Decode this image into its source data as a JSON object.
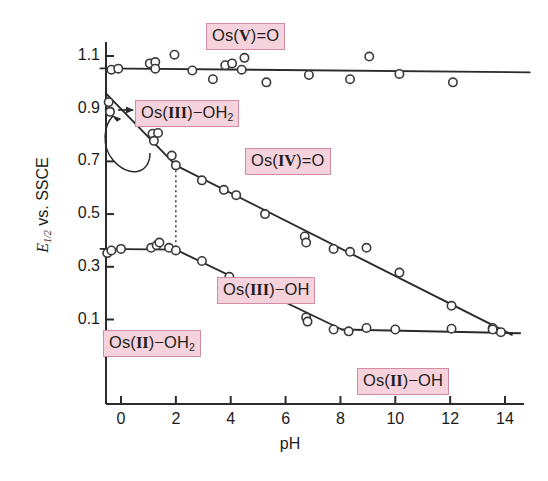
{
  "chart_data": {
    "type": "scatter",
    "title": "",
    "xlabel": "pH",
    "ylabel": "E1/2 vs. SSCE",
    "ylabel_parts": {
      "symbol": "E",
      "subscript": "1/2",
      "rest": " vs. SSCE"
    },
    "xlim": [
      -0.9,
      15.0
    ],
    "ylim": [
      -0.03,
      1.2
    ],
    "xticks": [
      "0",
      "2",
      "4",
      "6",
      "8",
      "10",
      "12",
      "14"
    ],
    "xtick_values": [
      0,
      2,
      4,
      6,
      8,
      10,
      12,
      14
    ],
    "yticks": [
      "1.1",
      "0.9",
      "0.7",
      "0.5",
      "0.3",
      "0.1"
    ],
    "ytick_values": [
      1.1,
      0.9,
      0.7,
      0.5,
      0.3,
      0.1
    ],
    "grid": false,
    "legend": "none",
    "marker": "open-circle",
    "series": [
      {
        "name": "Os(V)=O / Os(IV)=O couple",
        "points": [
          [
            -0.35,
            1.048
          ],
          [
            -0.1,
            1.052
          ],
          [
            1.05,
            1.072
          ],
          [
            1.25,
            1.077
          ],
          [
            1.25,
            1.052
          ],
          [
            1.95,
            1.105
          ],
          [
            2.6,
            1.045
          ],
          [
            3.35,
            1.012
          ],
          [
            3.8,
            1.065
          ],
          [
            4.05,
            1.072
          ],
          [
            4.4,
            1.048
          ],
          [
            4.5,
            1.093
          ],
          [
            5.3,
            1.0
          ],
          [
            6.85,
            1.028
          ],
          [
            8.35,
            1.012
          ],
          [
            9.05,
            1.098
          ],
          [
            10.15,
            1.032
          ],
          [
            12.1,
            1.0
          ]
        ]
      },
      {
        "name": "Os(IV)=O / Os(III) couple",
        "points": [
          [
            -0.45,
            0.925
          ],
          [
            -0.4,
            0.888
          ],
          [
            1.15,
            0.805
          ],
          [
            1.35,
            0.808
          ],
          [
            1.2,
            0.778
          ],
          [
            1.85,
            0.722
          ],
          [
            2.0,
            0.685
          ],
          [
            2.95,
            0.628
          ],
          [
            3.75,
            0.592
          ],
          [
            4.2,
            0.572
          ],
          [
            5.25,
            0.5
          ],
          [
            6.7,
            0.415
          ],
          [
            6.75,
            0.392
          ],
          [
            7.75,
            0.368
          ],
          [
            8.35,
            0.357
          ],
          [
            8.95,
            0.372
          ],
          [
            10.15,
            0.278
          ],
          [
            12.05,
            0.152
          ],
          [
            13.55,
            0.068
          ]
        ]
      },
      {
        "name": "Os(III) / Os(II) couple",
        "points": [
          [
            -0.5,
            0.352
          ],
          [
            -0.35,
            0.362
          ],
          [
            0.0,
            0.368
          ],
          [
            1.1,
            0.372
          ],
          [
            1.3,
            0.382
          ],
          [
            1.4,
            0.392
          ],
          [
            1.75,
            0.372
          ],
          [
            2.0,
            0.362
          ],
          [
            2.95,
            0.322
          ],
          [
            3.95,
            0.262
          ],
          [
            4.4,
            0.238
          ],
          [
            5.3,
            0.182
          ],
          [
            6.75,
            0.108
          ],
          [
            6.8,
            0.092
          ],
          [
            7.75,
            0.062
          ],
          [
            8.3,
            0.055
          ],
          [
            8.95,
            0.068
          ],
          [
            10.0,
            0.062
          ],
          [
            12.05,
            0.065
          ],
          [
            13.55,
            0.062
          ],
          [
            13.85,
            0.052
          ]
        ]
      }
    ],
    "fit_lines": [
      {
        "name": "Os(V)=O line",
        "from": [
          -0.75,
          1.053
        ],
        "to": [
          14.9,
          1.038
        ]
      },
      {
        "name": "Os(III)-OH2 steep line",
        "from": [
          -0.55,
          0.958
        ],
        "to": [
          2.0,
          0.685
        ]
      },
      {
        "name": "Os(IV)=O sloped line",
        "from": [
          2.0,
          0.685
        ],
        "to": [
          14.25,
          0.042
        ]
      },
      {
        "name": "Os(II)-OH2 flat line",
        "from": [
          -0.75,
          0.368
        ],
        "to": [
          2.0,
          0.365
        ]
      },
      {
        "name": "Os(III)-OH sloped line",
        "from": [
          2.0,
          0.365
        ],
        "to": [
          8.05,
          0.062
        ]
      },
      {
        "name": "Os(II)-OH flat line",
        "from": [
          8.05,
          0.062
        ],
        "to": [
          14.55,
          0.048
        ]
      }
    ],
    "reference_lines": [
      {
        "name": "pH 2 dotted drop line",
        "style": "dotted",
        "x": 2.0,
        "y_from": 0.685,
        "y_to": 0.362
      }
    ],
    "annotations": [
      {
        "name": "os-v-oxo-label",
        "text_prefix": "Os(",
        "roman": "V",
        "text_suffix": ")=O",
        "x_px": 206,
        "y_px": 23
      },
      {
        "name": "os-iii-oh2-label",
        "text_prefix": "Os(",
        "roman": "III",
        "text_suffix": ")−OH",
        "subscript": "2",
        "x_px": 135,
        "y_px": 100,
        "has_arrow": true
      },
      {
        "name": "os-iv-oxo-label",
        "text_prefix": "Os(",
        "roman": "IV",
        "text_suffix": ")=O",
        "x_px": 245,
        "y_px": 148
      },
      {
        "name": "os-iii-oh-label",
        "text_prefix": "Os(",
        "roman": "III",
        "text_suffix": ")−OH",
        "x_px": 217,
        "y_px": 277
      },
      {
        "name": "os-ii-oh2-label",
        "text_prefix": "Os(",
        "roman": "II",
        "text_suffix": ")−OH",
        "subscript": "2",
        "x_px": 103,
        "y_px": 330
      },
      {
        "name": "os-ii-oh-label",
        "text_prefix": "Os(",
        "roman": "II",
        "text_suffix": ")−OH",
        "x_px": 357,
        "y_px": 368
      }
    ],
    "colors": {
      "box_fill": "#f6d2dc",
      "box_border": "#d38da3",
      "axis": "#2b2b2b",
      "marker_stroke": "#3a3a3a",
      "background": "#ffffff"
    }
  }
}
